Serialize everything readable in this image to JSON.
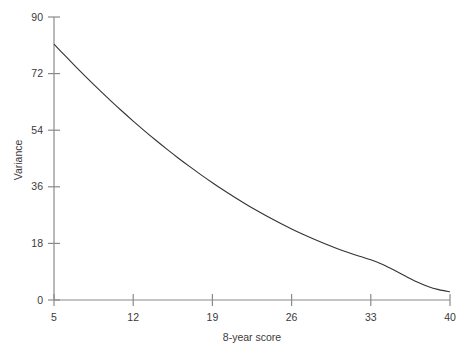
{
  "chart_data": {
    "type": "line",
    "title": "",
    "subtitle": "",
    "xlabel": "8-year score",
    "ylabel": "Variance",
    "xlim": [
      5,
      40
    ],
    "ylim": [
      0,
      90
    ],
    "xticks": [
      5,
      12,
      19,
      26,
      33,
      40
    ],
    "xtick_labels": [
      "5",
      "12",
      "19",
      "26",
      "33",
      "40"
    ],
    "yticks": [
      0,
      18,
      36,
      54,
      72,
      90
    ],
    "ytick_labels": [
      "0",
      "18",
      "36",
      "54",
      "72",
      "90"
    ],
    "grid": false,
    "legend": null,
    "legend_position": "none",
    "annotations": [],
    "series": [
      {
        "name": "Variance",
        "color": "#333333",
        "line_width": 1.1,
        "x": [
          5,
          6,
          7,
          8,
          9,
          10,
          11,
          12,
          13,
          14,
          15,
          16,
          17,
          18,
          19,
          20,
          21,
          22,
          23,
          24,
          25,
          26,
          27,
          28,
          29,
          30,
          31,
          32,
          33,
          34,
          35,
          36,
          37,
          38,
          39,
          40
        ],
        "values": [
          81.4,
          77.6,
          73.9,
          70.3,
          66.8,
          63.4,
          60.1,
          56.9,
          53.8,
          50.8,
          47.9,
          45.1,
          42.4,
          39.8,
          37.3,
          34.9,
          32.6,
          30.4,
          28.3,
          26.3,
          24.4,
          22.6,
          20.9,
          19.3,
          17.8,
          16.4,
          15.1,
          13.9,
          12.8,
          11.4,
          9.6,
          7.7,
          5.9,
          4.4,
          3.3,
          2.6
        ]
      }
    ],
    "colors": {
      "curve": "#333333",
      "axis": "#8a8a8a",
      "tick_text": "#3a3a3a",
      "background": "#ffffff"
    }
  },
  "axes": {
    "y_title": "Variance",
    "x_title": "8-year score"
  }
}
